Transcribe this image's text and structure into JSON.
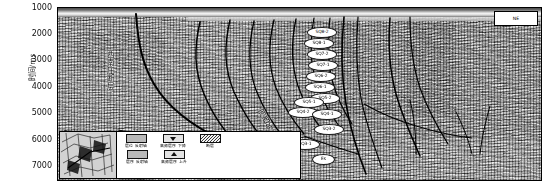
{
  "figure": {
    "type": "seismic-interpretation-section",
    "y_axis": {
      "label": "时间/ms",
      "ticks": [
        "1000",
        "2000",
        "3000",
        "4000",
        "5000",
        "6000",
        "7000"
      ],
      "range_top": 1000,
      "range_bottom": 7000
    },
    "corner_tag": "NE",
    "annotations": {
      "fault_left": "西南庄断层",
      "fault_center": "河西务断层"
    },
    "sequence_labels": [
      "SQ8-2",
      "SQ8-1",
      "SQ7-2",
      "SQ7-1",
      "SQ6-2",
      "SQ6-1",
      "SQ5-2",
      "SQ5-1",
      "SQ4-2",
      "SQ4-1",
      "SQ3-2",
      "SQ3-1",
      "Es"
    ]
  },
  "legend": {
    "items": [
      {
        "symbol": "filled-box",
        "label": "层位\n反射轴"
      },
      {
        "symbol": "triangle-down",
        "label": "高频层序\n下降"
      },
      {
        "symbol": "hatched-box",
        "label": "断层"
      },
      {
        "symbol": "pale-box",
        "label": "层序\n反射轴"
      },
      {
        "symbol": "triangle-up",
        "label": "高频层序\n上升"
      }
    ]
  },
  "inset_map": {
    "name": "structural-index-map"
  },
  "colors": {
    "ink": "#000000",
    "panel_bg": "#9a9a9a",
    "label_fill": "#ffffff"
  }
}
